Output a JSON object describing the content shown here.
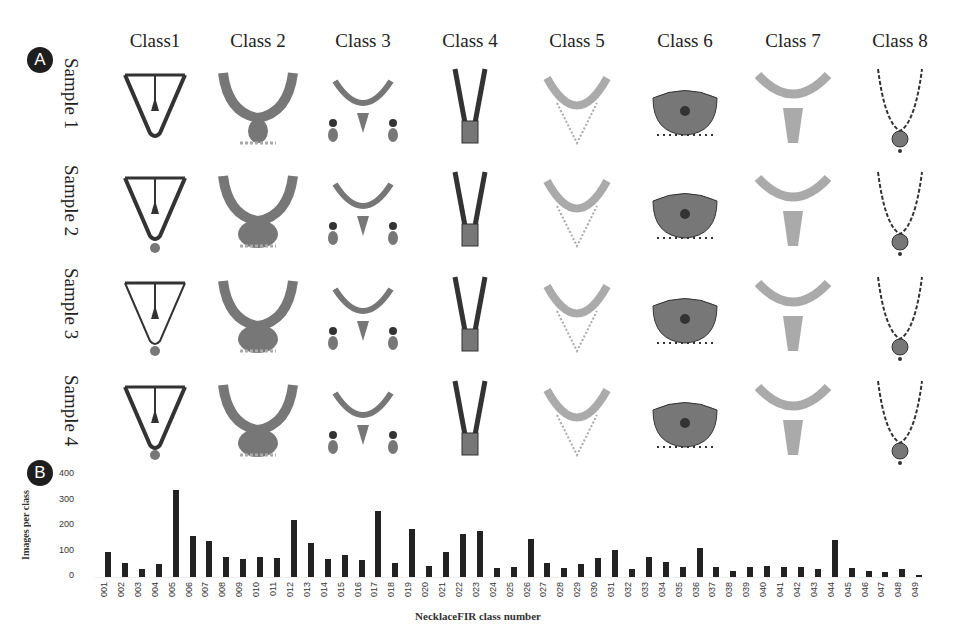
{
  "panel_a": {
    "badge": "A",
    "class_headers": [
      "Class1",
      "Class 2",
      "Class 3",
      "Class 4",
      "Class 5",
      "Class 6",
      "Class 7",
      "Class 8"
    ],
    "sample_labels": [
      "Sample 1",
      "Sample 2",
      "Sample 3",
      "Sample 4"
    ],
    "grid_description": "4 rows (samples) x 8 columns (classes) of grayscale necklace images"
  },
  "panel_b": {
    "badge": "B"
  },
  "chart_data": {
    "type": "bar",
    "title": "",
    "xlabel": "NecklaceFIR class number",
    "ylabel": "Images per class",
    "ylim": [
      0,
      400
    ],
    "yticks": [
      0,
      100,
      200,
      300,
      400
    ],
    "grid": false,
    "legend": null,
    "categories": [
      "001",
      "002",
      "003",
      "004",
      "005",
      "006",
      "007",
      "008",
      "009",
      "010",
      "011",
      "012",
      "013",
      "014",
      "015",
      "016",
      "017",
      "018",
      "019",
      "020",
      "021",
      "022",
      "023",
      "024",
      "025",
      "026",
      "027",
      "028",
      "029",
      "030",
      "031",
      "032",
      "033",
      "034",
      "035",
      "036",
      "037",
      "038",
      "039",
      "040",
      "041",
      "042",
      "043",
      "044",
      "045",
      "046",
      "047",
      "048",
      "049"
    ],
    "values": [
      100,
      55,
      30,
      50,
      340,
      160,
      140,
      80,
      70,
      80,
      75,
      225,
      135,
      70,
      85,
      65,
      260,
      55,
      190,
      45,
      100,
      170,
      180,
      35,
      40,
      150,
      55,
      35,
      50,
      75,
      105,
      30,
      80,
      60,
      40,
      115,
      40,
      25,
      40,
      45,
      40,
      40,
      30,
      145,
      35,
      25,
      20,
      30,
      8
    ],
    "bar_color": "#222222"
  }
}
